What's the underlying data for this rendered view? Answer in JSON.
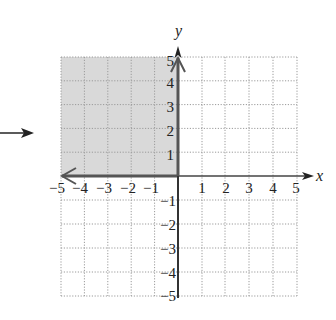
{
  "figure": {
    "pointer_arrow": "right-arrow",
    "x_axis_label": "x",
    "y_axis_label": "y",
    "x_ticks": [
      "−5",
      "−4",
      "−3",
      "−2",
      "−1",
      "1",
      "2",
      "3",
      "4",
      "5"
    ],
    "y_ticks": [
      "5",
      "4",
      "3",
      "2",
      "1",
      "−1",
      "−2",
      "−3",
      "−4",
      "−5"
    ],
    "range": {
      "xmin": -5,
      "xmax": 5,
      "ymin": -5,
      "ymax": 5
    },
    "shaded_region": {
      "xmin": -5,
      "xmax": 0,
      "ymin": 0,
      "ymax": 5,
      "color": "#d9d9d9"
    },
    "boundary_rays": [
      {
        "from": [
          0,
          0
        ],
        "direction": "positive-y",
        "arrow": true
      },
      {
        "from": [
          0,
          0
        ],
        "direction": "negative-x",
        "arrow": true
      }
    ],
    "colors": {
      "axis": "#333333",
      "grid": "#9a9a9a",
      "shade": "#d9d9d9"
    }
  }
}
